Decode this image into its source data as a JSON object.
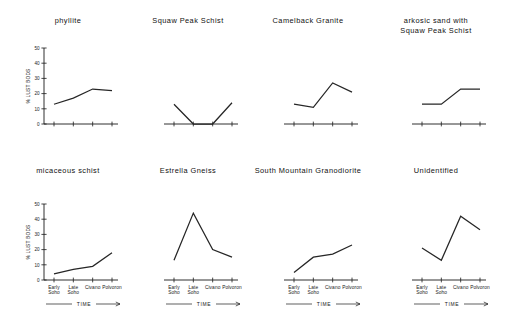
{
  "figure": {
    "axis_label_y": "% LUST BODS",
    "axis_label_x": "TIME",
    "y_ticks": [
      "0",
      "10",
      "20",
      "30",
      "40",
      "50"
    ],
    "x_ticks": [
      "Early\nSoho",
      "Late\nSoho",
      "Civano",
      "Polvoron"
    ],
    "line_color": "#262626",
    "axis_color": "#1a1a1a",
    "background": "#ffffff"
  },
  "chart_data": {
    "type": "line",
    "title": "",
    "xlabel": "TIME",
    "ylabel": "% LUST BODS",
    "ylim": [
      0,
      50
    ],
    "yticks": [
      0,
      10,
      20,
      30,
      40,
      50
    ],
    "grid": false,
    "legend": "none",
    "categories": [
      "Early Soho",
      "Late Soho",
      "Civano",
      "Polvoron"
    ],
    "panels": [
      {
        "index": 0,
        "row": 0,
        "col": 0,
        "title": "phyllite",
        "title_lines": [
          "phyllite"
        ],
        "values": [
          13,
          17,
          23,
          22
        ],
        "show_y_axis": true,
        "show_x_labels": false
      },
      {
        "index": 1,
        "row": 0,
        "col": 1,
        "title": "Squaw Peak Schist",
        "title_lines": [
          "Squaw Peak Schist"
        ],
        "values": [
          13,
          0,
          0,
          14
        ],
        "show_y_axis": false,
        "show_x_labels": false
      },
      {
        "index": 2,
        "row": 0,
        "col": 2,
        "title": "Camelback Granite",
        "title_lines": [
          "Camelback Granite"
        ],
        "values": [
          13,
          11,
          27,
          21
        ],
        "show_y_axis": false,
        "show_x_labels": false
      },
      {
        "index": 3,
        "row": 0,
        "col": 3,
        "title": "arkosic sand with Squaw Peak Schist",
        "title_lines": [
          "arkosic sand with",
          "Squaw Peak Schist"
        ],
        "values": [
          13,
          13,
          23,
          23
        ],
        "show_y_axis": false,
        "show_x_labels": false
      },
      {
        "index": 4,
        "row": 1,
        "col": 0,
        "title": "micaceous schist",
        "title_lines": [
          "micaceous schist"
        ],
        "values": [
          4,
          7,
          9,
          18
        ],
        "show_y_axis": true,
        "show_x_labels": true
      },
      {
        "index": 5,
        "row": 1,
        "col": 1,
        "title": "Estrella Gneiss",
        "title_lines": [
          "Estrella Gneiss"
        ],
        "values": [
          13,
          44,
          20,
          15
        ],
        "show_y_axis": false,
        "show_x_labels": true
      },
      {
        "index": 6,
        "row": 1,
        "col": 2,
        "title": "South Mountain Granodiorite",
        "title_lines": [
          "South Mountain Granodiorite"
        ],
        "values": [
          5,
          15,
          17,
          23
        ],
        "show_y_axis": false,
        "show_x_labels": true
      },
      {
        "index": 7,
        "row": 1,
        "col": 3,
        "title": "Unidentified",
        "title_lines": [
          "Unidentified"
        ],
        "values": [
          21,
          13,
          42,
          33
        ],
        "show_y_axis": false,
        "show_x_labels": true
      }
    ]
  }
}
